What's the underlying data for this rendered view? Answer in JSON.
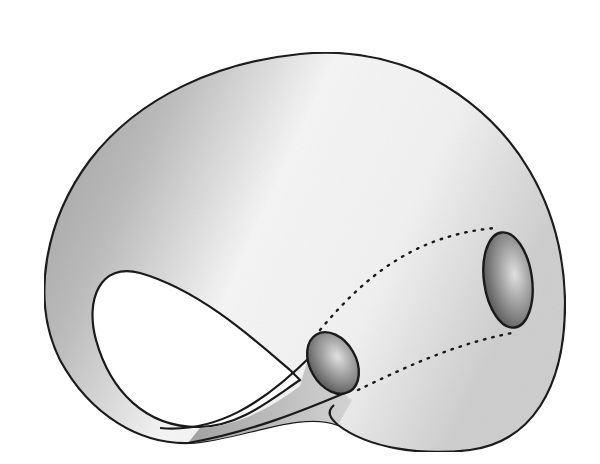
{
  "figure": {
    "subject": "Klein bottle",
    "colors": {
      "background": "#ffffff",
      "outline": "#1a1a1a",
      "surface_dark": "#9a9a9a",
      "surface_light": "#f4f4f4",
      "hole_dark": "#555555",
      "hole_light": "#d8d8d8"
    },
    "parts": {
      "body": "outer-surface",
      "loop_hole": "inner-loop-hole",
      "neck_opening": "neck-opening-ellipse",
      "base_opening": "base-opening-ellipse",
      "hidden_tube": "dotted-hidden-tube"
    }
  }
}
